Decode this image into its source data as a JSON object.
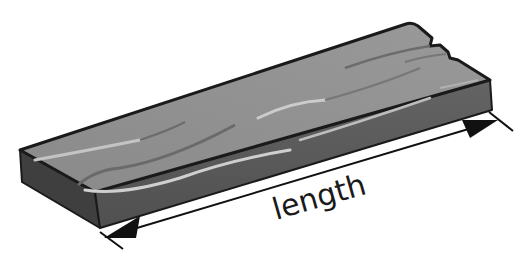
{
  "figure": {
    "object": "wooden plank",
    "dimension_label": "length",
    "colors": {
      "top_face": "#8e8e8e",
      "front_face": "#5a5a5a",
      "end_face": "#3e3e3e",
      "outline": "#1a1a1a",
      "highlight": "#c8c8c8",
      "groove": "#6a6a6a",
      "arrow": "#111111",
      "background": "#ffffff"
    }
  }
}
